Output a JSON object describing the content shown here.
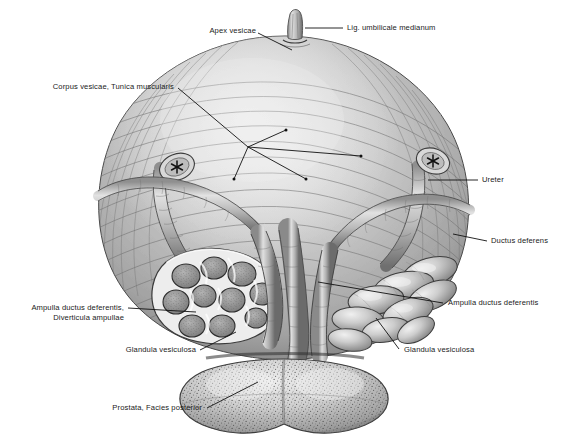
{
  "figure": {
    "view": "posterior view",
    "style": "grayscale anatomical engraving",
    "background_color": "#ffffff",
    "ink_color": "#1a1a1a",
    "marker_symbol": "✳"
  },
  "labels": {
    "apex_vesicae": "Apex vesicae",
    "lig_umbilicale": "Lig. umbilicale medianum",
    "corpus_vesicae": "Corpus vesicae, Tunica muscularis",
    "ureter": "Ureter",
    "ductus_deferens": "Ductus deferens",
    "ampulla_left_1": "Ampulla ductus deferentis,",
    "ampulla_left_2": "Diverticula ampullae",
    "glandula_left": "Glandula vesiculosa",
    "ampulla_right": "Ampulla ductus deferentis",
    "glandula_right": "Glandula vesiculosa",
    "prostata": "Prostata, Facies posterior"
  },
  "structures": [
    {
      "name": "vesica-urinaria",
      "label": "Corpus vesicae, Tunica muscularis",
      "side": "median"
    },
    {
      "name": "apex-vesicae",
      "label": "Apex vesicae",
      "side": "median"
    },
    {
      "name": "lig-umbilicale-medianum",
      "label": "Lig. umbilicale medianum",
      "side": "median"
    },
    {
      "name": "ureter-left",
      "label": "Ureter",
      "side": "left",
      "cut": true
    },
    {
      "name": "ureter-right",
      "label": "Ureter",
      "side": "right",
      "cut": true
    },
    {
      "name": "ductus-deferens-left",
      "label": "Ductus deferens",
      "side": "left"
    },
    {
      "name": "ductus-deferens-right",
      "label": "Ductus deferens",
      "side": "right"
    },
    {
      "name": "ampulla-ductus-deferentis-left",
      "label": "Ampulla ductus deferentis, Diverticula ampullae",
      "side": "left",
      "sectioned": true
    },
    {
      "name": "ampulla-ductus-deferentis-right",
      "label": "Ampulla ductus deferentis",
      "side": "right",
      "sectioned": false
    },
    {
      "name": "glandula-vesiculosa-left",
      "label": "Glandula vesiculosa",
      "side": "left",
      "sectioned": true
    },
    {
      "name": "glandula-vesiculosa-right",
      "label": "Glandula vesiculosa",
      "side": "right",
      "sectioned": false
    },
    {
      "name": "prostata",
      "label": "Prostata, Facies posterior",
      "side": "median"
    }
  ]
}
